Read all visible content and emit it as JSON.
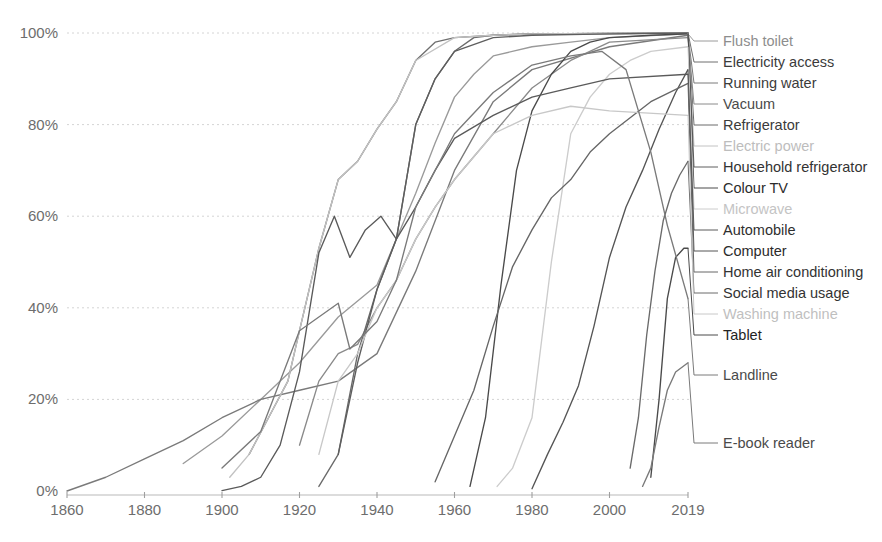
{
  "chart_data": {
    "type": "line",
    "title": "",
    "subtitle": "",
    "xlabel": "",
    "ylabel": "",
    "xlim": [
      1860,
      2019
    ],
    "ylim": [
      0,
      100
    ],
    "grid": true,
    "legend_position": "right-labels-with-leader-lines",
    "x_ticks": [
      1860,
      1880,
      1900,
      1920,
      1940,
      1960,
      1980,
      2000,
      2019
    ],
    "x_tick_labels": [
      "1860",
      "1880",
      "1900",
      "1920",
      "1940",
      "1960",
      "1980",
      "2000",
      "2019"
    ],
    "y_ticks": [
      0,
      20,
      40,
      60,
      80,
      100
    ],
    "y_tick_labels": [
      "0%",
      "20%",
      "40%",
      "60%",
      "80%",
      "100%"
    ],
    "series": [
      {
        "name": "Flush toilet",
        "label": "Flush toilet",
        "color": "#9a9a9a",
        "label_color": "#8d8d8d",
        "label_y": 41,
        "x": [
          1890,
          1900,
          1910,
          1920,
          1930,
          1940,
          1945,
          1950,
          1955,
          1960,
          1965,
          1970,
          1980,
          1990,
          2000,
          2019
        ],
        "values": [
          6,
          12,
          20,
          28,
          38,
          45,
          55,
          65,
          76,
          86,
          91,
          95,
          97,
          98,
          99,
          99.8
        ]
      },
      {
        "name": "Electricity access",
        "label": "Electricity access",
        "color": "#6f6f6f",
        "label_color": "#3b3b3b",
        "label_y": 62,
        "x": [
          1907,
          1912,
          1917,
          1920,
          1925,
          1930,
          1935,
          1940,
          1945,
          1950,
          1955,
          1960,
          1970,
          1980,
          2000,
          2019
        ],
        "values": [
          8,
          16,
          24,
          35,
          53,
          68,
          72,
          79,
          85,
          94,
          98,
          99,
          99.5,
          99.8,
          99.9,
          100
        ]
      },
      {
        "name": "Running water",
        "label": "Running water",
        "color": "#7a7a7a",
        "label_color": "#3b3b3b",
        "label_y": 83,
        "x": [
          1860,
          1870,
          1880,
          1890,
          1900,
          1910,
          1920,
          1930,
          1940,
          1950,
          1960,
          1970,
          1980,
          2000,
          2019
        ],
        "values": [
          0,
          3,
          7,
          11,
          16,
          20,
          22,
          24,
          30,
          48,
          70,
          85,
          92,
          97,
          99.5
        ]
      },
      {
        "name": "Vacuum",
        "label": "Vacuum",
        "color": "#8a8a8a",
        "label_color": "#4a4a4a",
        "label_y": 104,
        "x": [
          1920,
          1925,
          1930,
          1935,
          1940,
          1945,
          1950,
          1955,
          1960,
          1970,
          1980,
          1990,
          2000,
          2019
        ],
        "values": [
          10,
          24,
          30,
          32,
          40,
          46,
          55,
          62,
          68,
          78,
          88,
          94,
          98,
          99
        ]
      },
      {
        "name": "Refrigerator",
        "label": "Refrigerator",
        "color": "#6a6a6a",
        "label_color": "#3b3b3b",
        "label_y": 125,
        "x": [
          1925,
          1930,
          1935,
          1940,
          1945,
          1950,
          1955,
          1960,
          1965,
          1970,
          1980,
          2000,
          2019
        ],
        "values": [
          1,
          8,
          30,
          44,
          55,
          80,
          90,
          96,
          99,
          99.5,
          99.8,
          99.9,
          100
        ]
      },
      {
        "name": "Electric power",
        "label": "Electric power",
        "color": "#c2c2c2",
        "label_color": "#bdbdbd",
        "label_y": 146,
        "x": [
          1902,
          1907,
          1912,
          1917,
          1920,
          1925,
          1930,
          1935,
          1940,
          1945,
          1950,
          1960,
          1970,
          1980,
          2000,
          2019
        ],
        "values": [
          3,
          8,
          16,
          24,
          35,
          53,
          68,
          72,
          79,
          85,
          94,
          99,
          99.5,
          99.8,
          99.9,
          100
        ]
      },
      {
        "name": "Household refrigerator",
        "label": "Household refrigerator",
        "color": "#5e5e5e",
        "label_color": "#333333",
        "label_y": 167,
        "x": [
          1930,
          1935,
          1940,
          1945,
          1950,
          1955,
          1960,
          1970,
          1980,
          2000,
          2019
        ],
        "values": [
          8,
          28,
          44,
          55,
          80,
          90,
          96,
          99,
          99.5,
          99.8,
          100
        ]
      },
      {
        "name": "Colour TV",
        "label": "Colour TV",
        "color": "#4a4a4a",
        "label_color": "#2b2b2b",
        "label_y": 188,
        "x": [
          1964,
          1968,
          1972,
          1976,
          1980,
          1985,
          1990,
          1995,
          2000,
          2010,
          2019
        ],
        "values": [
          1,
          16,
          45,
          70,
          83,
          91,
          96,
          98,
          99,
          99.5,
          99.8
        ]
      },
      {
        "name": "Microwave",
        "label": "Microwave",
        "color": "#cccccc",
        "label_color": "#c4c4c4",
        "label_y": 209,
        "x": [
          1971,
          1975,
          1980,
          1985,
          1990,
          1995,
          2000,
          2005,
          2010,
          2019
        ],
        "values": [
          1,
          5,
          16,
          50,
          78,
          86,
          91,
          94,
          96,
          97
        ]
      },
      {
        "name": "Automobile",
        "label": "Automobile",
        "color": "#5a5a5a",
        "label_color": "#2f2f2f",
        "label_y": 230,
        "x": [
          1900,
          1905,
          1910,
          1915,
          1920,
          1925,
          1929,
          1933,
          1937,
          1941,
          1945,
          1950,
          1955,
          1960,
          1970,
          1980,
          1990,
          2000,
          2019
        ],
        "values": [
          0.1,
          1,
          3,
          10,
          26,
          52,
          60,
          51,
          57,
          60,
          55,
          62,
          70,
          77,
          82,
          86,
          88,
          90,
          91
        ]
      },
      {
        "name": "Computer",
        "label": "Computer",
        "color": "#555555",
        "label_color": "#2b2b2b",
        "label_y": 251,
        "x": [
          1980,
          1984,
          1988,
          1992,
          1996,
          2000,
          2004,
          2008,
          2012,
          2016,
          2019
        ],
        "values": [
          0.5,
          8,
          15,
          23,
          36,
          51,
          62,
          70,
          79,
          87,
          92
        ]
      },
      {
        "name": "Home air conditioning",
        "label": "Home air conditioning",
        "color": "#666666",
        "label_color": "#333333",
        "label_y": 272,
        "x": [
          1955,
          1960,
          1965,
          1970,
          1975,
          1980,
          1985,
          1990,
          1995,
          2000,
          2010,
          2019
        ],
        "values": [
          2,
          12,
          22,
          36,
          49,
          57,
          64,
          68,
          74,
          78,
          85,
          89
        ]
      },
      {
        "name": "Social media usage",
        "label": "Social media usage",
        "color": "#6a6a6a",
        "label_color": "#333333",
        "label_y": 293,
        "x": [
          2005,
          2007,
          2009,
          2011,
          2013,
          2015,
          2017,
          2019
        ],
        "values": [
          5,
          16,
          34,
          48,
          59,
          65,
          69,
          72
        ]
      },
      {
        "name": "Washing machine",
        "label": "Washing machine",
        "color": "#c8c8c8",
        "label_color": "#bfbfbf",
        "label_y": 314,
        "x": [
          1925,
          1930,
          1935,
          1940,
          1945,
          1950,
          1955,
          1960,
          1970,
          1980,
          1990,
          2000,
          2019
        ],
        "values": [
          8,
          24,
          30,
          40,
          46,
          55,
          62,
          68,
          78,
          82,
          84,
          83,
          82
        ]
      },
      {
        "name": "Tablet",
        "label": "Tablet",
        "color": "#4a4a4a",
        "label_color": "#232323",
        "label_y": 335,
        "x": [
          2010,
          2012,
          2014,
          2016,
          2018,
          2019
        ],
        "values": [
          3,
          20,
          42,
          51,
          53,
          53
        ]
      },
      {
        "name": "Landline",
        "label": "Landline",
        "color": "#7a7a7a",
        "label_color": "#4a4a4a",
        "label_y": 375,
        "x": [
          1900,
          1910,
          1920,
          1930,
          1933,
          1940,
          1945,
          1950,
          1960,
          1970,
          1980,
          1990,
          1998,
          2004,
          2010,
          2014,
          2019
        ],
        "values": [
          5,
          13,
          35,
          41,
          31,
          37,
          46,
          62,
          78,
          87,
          93,
          95,
          96,
          92,
          74,
          58,
          42
        ]
      },
      {
        "name": "E-book reader",
        "label": "E-book reader",
        "color": "#7a7a7a",
        "label_color": "#4a4a4a",
        "label_y": 443,
        "x": [
          2008,
          2010,
          2012,
          2014,
          2016,
          2019
        ],
        "values": [
          1,
          5,
          14,
          22,
          26,
          28
        ]
      }
    ]
  },
  "axes": {
    "y_axis_name": "share-of-us-households",
    "x_axis_name": "year"
  }
}
